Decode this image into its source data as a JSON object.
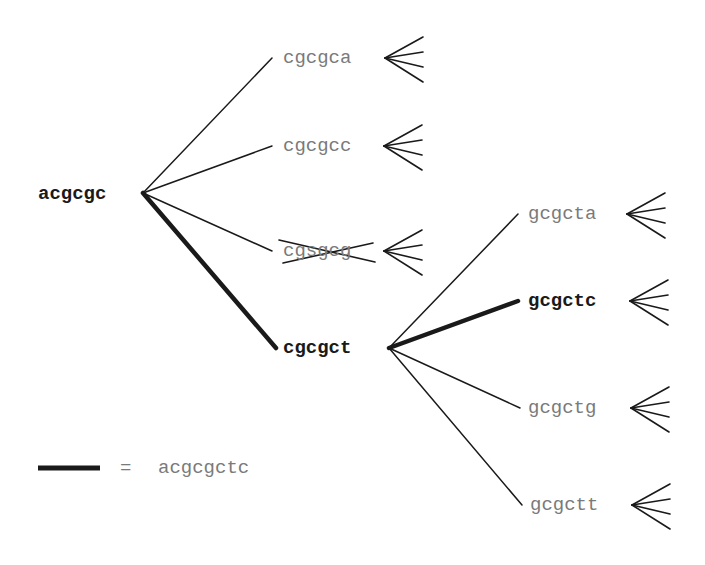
{
  "diagram": {
    "type": "search-tree",
    "root": {
      "id": "acgcgc",
      "label": "acgcgc",
      "bold": true,
      "x": 143,
      "y": 193,
      "label_x": 38,
      "label_y": 184
    },
    "level1": [
      {
        "id": "cgcgca",
        "label": "cgcgca",
        "bold": false,
        "pruned": false,
        "x": 272,
        "y": 58,
        "label_x": 283,
        "label_y": 48,
        "fan": {
          "x": 385,
          "y": 58
        }
      },
      {
        "id": "cgcgcc",
        "label": "cgcgcc",
        "bold": false,
        "pruned": false,
        "x": 272,
        "y": 146,
        "label_x": 283,
        "label_y": 136,
        "fan": {
          "x": 384,
          "y": 146
        }
      },
      {
        "id": "cgsgcg",
        "label": "cgsgcg",
        "bold": false,
        "pruned": true,
        "x": 272,
        "y": 251,
        "label_x": 283,
        "label_y": 241,
        "fan": {
          "x": 384,
          "y": 251
        }
      },
      {
        "id": "cgcgct",
        "label": "cgcgct",
        "bold": true,
        "pruned": false,
        "x": 276,
        "y": 348,
        "label_x": 283,
        "label_y": 338,
        "on_path": true
      }
    ],
    "level2_parent": {
      "id": "cgcgct",
      "x": 389,
      "y": 348
    },
    "level2": [
      {
        "id": "gcgcta",
        "label": "gcgcta",
        "bold": false,
        "x": 518,
        "y": 214,
        "label_x": 528,
        "label_y": 204,
        "fan": {
          "x": 627,
          "y": 214
        }
      },
      {
        "id": "gcgctc",
        "label": "gcgctc",
        "bold": true,
        "x": 518,
        "y": 301,
        "label_x": 528,
        "label_y": 291,
        "fan": {
          "x": 630,
          "y": 301
        },
        "on_path": true
      },
      {
        "id": "gcgctg",
        "label": "gcgctg",
        "bold": false,
        "x": 520,
        "y": 408,
        "label_x": 528,
        "label_y": 398,
        "fan": {
          "x": 631,
          "y": 408
        }
      },
      {
        "id": "gcgctt",
        "label": "gcgctt",
        "bold": false,
        "x": 522,
        "y": 505,
        "label_x": 530,
        "label_y": 495,
        "fan": {
          "x": 632,
          "y": 505
        }
      }
    ],
    "legend": {
      "line_label": "bold-path-line",
      "equals": "=",
      "value": "acgcgctc"
    },
    "colors": {
      "line": "#1a1a1a",
      "bold_text": "#1a1a1a",
      "dim_text": "#7a7a7a",
      "background": "#ffffff"
    }
  }
}
